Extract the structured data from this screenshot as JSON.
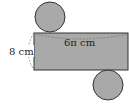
{
  "diagram": {
    "type": "cylinder-net",
    "labels": {
      "height": "8 cm",
      "circumference": "6π cm"
    },
    "colors": {
      "fill": "#a9a9a9",
      "stroke": "#333333",
      "dashed": "#888888",
      "background": "#ffffff"
    },
    "shapes": {
      "top_circle": {
        "cx": 50,
        "cy": 17,
        "r": 15
      },
      "rectangle": {
        "x": 34,
        "y": 33,
        "width": 94,
        "height": 37
      },
      "bottom_circle": {
        "cx": 108,
        "cy": 85,
        "r": 15
      }
    }
  }
}
